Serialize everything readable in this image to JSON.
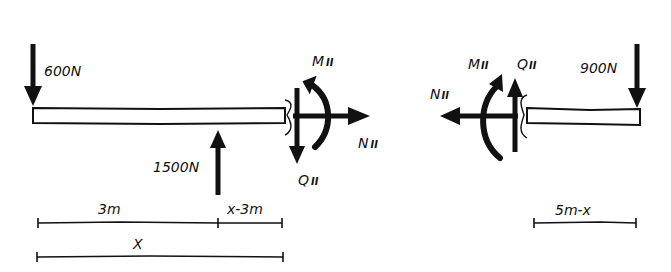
{
  "diagram": {
    "type": "free-body diagram (beam section cut)",
    "colors": {
      "ink": "#111111",
      "background": "#ffffff"
    },
    "left_part": {
      "loads": {
        "load_600": {
          "label": "600N",
          "direction": "down"
        },
        "load_1500": {
          "label": "1500N",
          "direction": "up"
        }
      },
      "internal_forces": {
        "moment": {
          "label": "M",
          "sub": "II",
          "direction": "counter-clockwise"
        },
        "normal": {
          "label": "N",
          "sub": "II",
          "direction": "right"
        },
        "shear": {
          "label": "Q",
          "sub": "II",
          "direction": "down"
        }
      },
      "dimensions": {
        "seg_3m": "3m",
        "seg_x_minus_3m": "x-3m",
        "total_x": "X"
      }
    },
    "right_part": {
      "loads": {
        "load_900": {
          "label": "900N",
          "direction": "down"
        }
      },
      "internal_forces": {
        "moment": {
          "label": "M",
          "sub": "II",
          "direction": "clockwise"
        },
        "normal": {
          "label": "N",
          "sub": "II",
          "direction": "left"
        },
        "shear": {
          "label": "Q",
          "sub": "II",
          "direction": "up"
        }
      },
      "dimensions": {
        "seg_5m_minus_x": "5m-x"
      }
    }
  }
}
